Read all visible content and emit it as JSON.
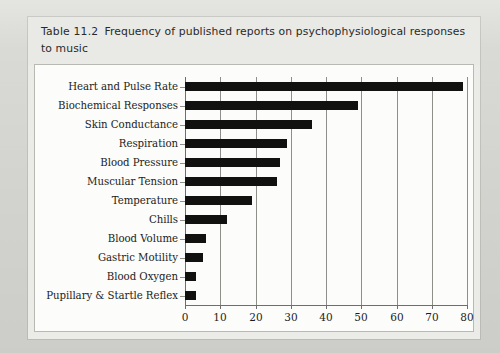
{
  "figure": {
    "caption_label": "Table 11.2",
    "caption_text": "Frequency of published reports on psychophysiological responses to music"
  },
  "chart_data": {
    "type": "bar",
    "orientation": "horizontal",
    "xlabel": "",
    "ylabel": "",
    "xlim": [
      0,
      80
    ],
    "xticks": [
      0,
      10,
      20,
      30,
      40,
      50,
      60,
      70,
      80
    ],
    "grid": "vertical",
    "legend": "none",
    "bar_color": "#111110",
    "categories": [
      "Heart and Pulse Rate",
      "Biochemical Responses",
      "Skin Conductance",
      "Respiration",
      "Blood Pressure",
      "Muscular Tension",
      "Temperature",
      "Chills",
      "Blood Volume",
      "Gastric Motility",
      "Blood Oxygen",
      "Pupillary & Startle Reflex"
    ],
    "values": [
      79,
      49,
      36,
      29,
      27,
      26,
      19,
      12,
      6,
      5,
      3,
      3
    ]
  },
  "colors": {
    "page_background": "#d9d9d5",
    "card_background": "#ebebe8",
    "title_band": "#e9e9e6",
    "plot_background": "#fcfcfa",
    "bar": "#111110",
    "gridline": "#8e8e8a",
    "text": "#1c1c1a"
  }
}
